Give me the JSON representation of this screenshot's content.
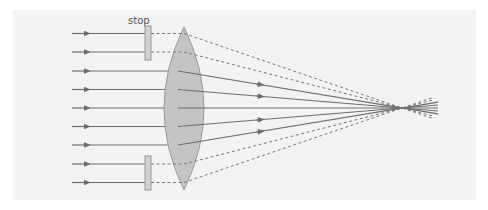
{
  "diagram": {
    "labels": {
      "stop": "stop"
    },
    "colors": {
      "background": "#ffffff",
      "panel": "#f3f3f3",
      "ray": "#6e6e6e",
      "blocked_ray": "#7a7a7a",
      "lens_fill": "#c4c4c4",
      "lens_stroke": "#9a9a9a",
      "stop_fill": "#d0d0d0",
      "stop_stroke": "#999999"
    },
    "lens": {
      "cx": 184,
      "top": 27,
      "bottom": 190,
      "half_width": 20
    },
    "stops": [
      {
        "x": 145,
        "y": 26,
        "w": 6,
        "h": 34
      },
      {
        "x": 145,
        "y": 156,
        "w": 6,
        "h": 34
      }
    ],
    "focus": {
      "x": 402,
      "y": 108
    },
    "rays_y": [
      33.5,
      52,
      71,
      89.5,
      108,
      126.5,
      145,
      164,
      182.5
    ],
    "blocked_rays": [
      0,
      1,
      7,
      8
    ]
  }
}
